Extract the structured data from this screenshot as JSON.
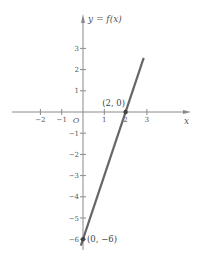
{
  "chart_data": {
    "type": "line",
    "title": "",
    "function_label": "y = f(x)",
    "xlabel": "x",
    "ylabel": "y = f(x)",
    "origin_label": "O",
    "xlim": [
      -2.7,
      4.3
    ],
    "ylim": [
      -6.4,
      3.9
    ],
    "grid": false,
    "x_ticks": [
      -2,
      -1,
      1,
      2,
      3
    ],
    "x_tick_labels": [
      "−2",
      "−1",
      "1",
      "2",
      "3"
    ],
    "y_ticks": [
      3,
      2,
      1,
      -1,
      -2,
      -3,
      -4,
      -5,
      -6
    ],
    "y_tick_labels": [
      "3",
      "2",
      "1",
      "−1",
      "−2",
      "−3",
      "−4",
      "−5",
      "−6"
    ],
    "series": [
      {
        "name": "f(x) = 3x − 6",
        "x": [
          -0.1,
          2.85
        ],
        "y": [
          -6.3,
          2.55
        ],
        "color": "#666666"
      }
    ],
    "annotations": [
      {
        "label": "(2, 0)",
        "x": 2,
        "y": 0
      },
      {
        "label": "(0, −6)",
        "x": 0,
        "y": -6
      }
    ]
  },
  "style": {
    "axis_color": "#8a8a8a",
    "line_color": "#666666",
    "point_color": "#444444"
  }
}
